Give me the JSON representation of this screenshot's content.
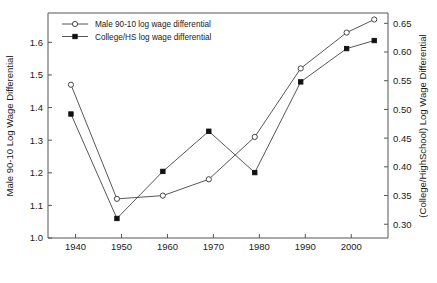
{
  "chart_data": {
    "type": "line",
    "title": "",
    "subtitle": "",
    "xlabel": "",
    "ylabel": "Male 90-10 Log Wage Differential",
    "y2label": "(College/HighSchool) Log Wage Differential",
    "grid": false,
    "legend_position": "top-left",
    "x": [
      1939,
      1949,
      1959,
      1969,
      1979,
      1989,
      1999,
      2005
    ],
    "xlim": [
      1934,
      2008
    ],
    "xticks": [
      1940,
      1950,
      1960,
      1970,
      1980,
      1990,
      2000
    ],
    "xtick_labels": [
      "1940",
      "1950",
      "1960",
      "1970",
      "1980",
      "1990",
      "2000"
    ],
    "ylim": [
      1.0,
      1.69
    ],
    "yticks": [
      1.0,
      1.1,
      1.2,
      1.3,
      1.4,
      1.5,
      1.6
    ],
    "ytick_labels": [
      "1.0",
      "1.1",
      "1.2",
      "1.3",
      "1.4",
      "1.5",
      "1.6"
    ],
    "y2lim": [
      0.276,
      0.668
    ],
    "y2ticks": [
      0.3,
      0.35,
      0.4,
      0.45,
      0.5,
      0.55,
      0.6,
      0.65
    ],
    "y2tick_labels": [
      "0.30",
      "0.35",
      "0.40",
      "0.45",
      "0.50",
      "0.55",
      "0.60",
      "0.65"
    ],
    "series": [
      {
        "name": "Male 90-10 log wage differential",
        "axis": "left",
        "marker": "open-circle",
        "values": [
          1.47,
          1.12,
          1.13,
          1.18,
          1.31,
          1.52,
          1.63,
          1.67
        ]
      },
      {
        "name": "College/HS log wage differential",
        "axis": "right",
        "marker": "filled-square",
        "values": [
          0.492,
          0.31,
          0.392,
          0.462,
          0.39,
          0.548,
          0.606,
          0.62
        ]
      }
    ]
  },
  "legend": {
    "entries": [
      {
        "label": "Male 90-10 log wage differential",
        "marker": "open-circle"
      },
      {
        "label": "College/HS log wage differential",
        "marker": "filled-square"
      }
    ]
  }
}
